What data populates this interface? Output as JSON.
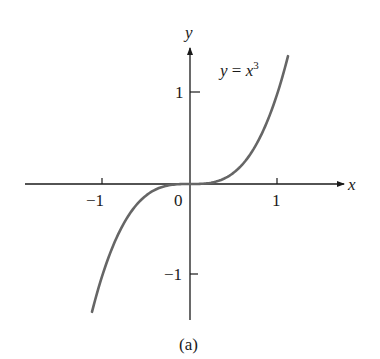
{
  "chart_data": {
    "type": "line",
    "title": "",
    "function": "y = x^3",
    "annotation": {
      "text_y": "y",
      "text_eq": " = ",
      "text_x": "x",
      "text_exp": "3"
    },
    "series": [
      {
        "name": "y = x^3",
        "x": [
          -1.12,
          -1.0,
          -0.75,
          -0.5,
          -0.25,
          0,
          0.25,
          0.5,
          0.75,
          1.0,
          1.12
        ],
        "y": [
          -1.405,
          -1.0,
          -0.422,
          -0.125,
          -0.016,
          0,
          0.016,
          0.125,
          0.422,
          1.0,
          1.405
        ]
      }
    ],
    "xlabel": "x",
    "ylabel": "y",
    "x_ticks": [
      -1,
      0,
      1
    ],
    "x_tick_labels": [
      "−1",
      "0",
      "1"
    ],
    "y_ticks": [
      1,
      -1
    ],
    "y_tick_labels": [
      "1",
      "−1"
    ],
    "xlim": [
      -1.88,
      1.8
    ],
    "ylim": [
      -1.5,
      1.5
    ],
    "grid": false,
    "legend": "none",
    "caption": "(a)",
    "colors": {
      "curve": "#666666",
      "axes": "#1a1a1a"
    }
  }
}
